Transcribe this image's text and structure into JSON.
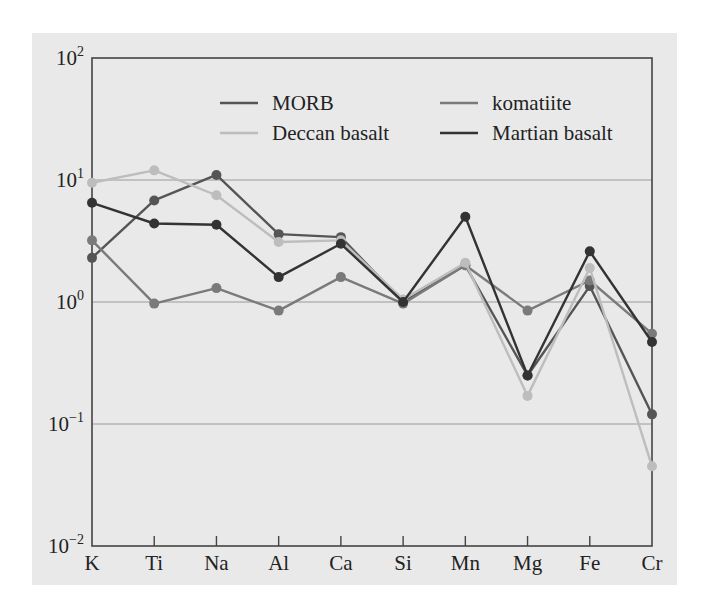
{
  "chart_data": {
    "type": "line",
    "title": "",
    "xlabel": "",
    "ylabel": "",
    "yscale": "log",
    "ylim": [
      0.01,
      100
    ],
    "yticks": [
      {
        "value": 100,
        "label_base": "10",
        "label_exp": "2"
      },
      {
        "value": 10,
        "label_base": "10",
        "label_exp": "1"
      },
      {
        "value": 1,
        "label_base": "10",
        "label_exp": "0"
      },
      {
        "value": 0.1,
        "label_base": "10",
        "label_exp": "−1"
      },
      {
        "value": 0.01,
        "label_base": "10",
        "label_exp": "−2"
      }
    ],
    "grid": true,
    "legend_position": "upper center, 2 columns",
    "categories": [
      "K",
      "Ti",
      "Na",
      "Al",
      "Ca",
      "Si",
      "Mn",
      "Mg",
      "Fe",
      "Cr"
    ],
    "series": [
      {
        "name": "MORB",
        "color": "#555555",
        "values": [
          2.3,
          6.8,
          11,
          3.6,
          3.4,
          1.0,
          2.0,
          0.25,
          1.35,
          0.12
        ]
      },
      {
        "name": "komatiite",
        "color": "#7a7a7a",
        "values": [
          3.2,
          0.97,
          1.3,
          0.85,
          1.6,
          0.97,
          2.0,
          0.85,
          1.5,
          0.55
        ]
      },
      {
        "name": "Deccan basalt",
        "color": "#bdbdbd",
        "values": [
          9.5,
          12,
          7.5,
          3.1,
          3.2,
          1.05,
          2.1,
          0.17,
          1.9,
          0.045
        ]
      },
      {
        "name": "Martian basalt",
        "color": "#333333",
        "values": [
          6.5,
          4.4,
          4.3,
          1.6,
          3.0,
          1.0,
          5.0,
          0.25,
          2.6,
          0.47
        ]
      }
    ]
  },
  "legend": {
    "items": [
      {
        "label": "MORB"
      },
      {
        "label": "komatiite"
      },
      {
        "label": "Deccan basalt"
      },
      {
        "label": "Martian basalt"
      }
    ]
  }
}
